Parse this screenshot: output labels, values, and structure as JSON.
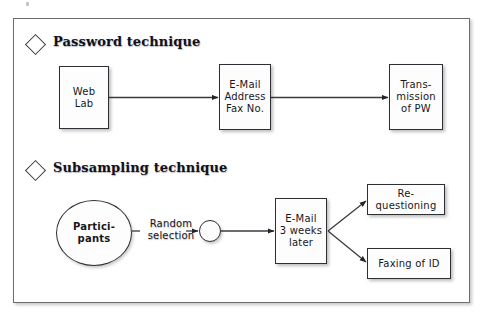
{
  "figure": {
    "sections": [
      {
        "id": "password",
        "bullet_icon": "diamond-bullet-icon",
        "heading": "Password technique",
        "nodes": [
          {
            "id": "web-lab",
            "shape": "box",
            "label": "Web\nLab"
          },
          {
            "id": "email-address",
            "shape": "box",
            "label": "E-Mail\nAddress\nFax No."
          },
          {
            "id": "transmission",
            "shape": "box",
            "label": "Trans-\nmission\nof PW"
          }
        ],
        "edges": [
          {
            "from": "web-lab",
            "to": "email-address",
            "label": ""
          },
          {
            "from": "email-address",
            "to": "transmission",
            "label": ""
          }
        ]
      },
      {
        "id": "subsampling",
        "bullet_icon": "diamond-bullet-icon",
        "heading": "Subsampling technique",
        "nodes": [
          {
            "id": "participants",
            "shape": "circle",
            "label": "Partici-\npants"
          },
          {
            "id": "junction",
            "shape": "circle",
            "label": ""
          },
          {
            "id": "email-3weeks",
            "shape": "box",
            "label": "E-Mail\n3 weeks\nlater"
          },
          {
            "id": "requestioning",
            "shape": "box",
            "label": "Re-\nquestioning"
          },
          {
            "id": "faxing",
            "shape": "box",
            "label": "Faxing of ID"
          }
        ],
        "edges": [
          {
            "from": "participants",
            "to": "junction",
            "label": "Random\nselection"
          },
          {
            "from": "junction",
            "to": "email-3weeks",
            "label": ""
          },
          {
            "from": "email-3weeks",
            "to": "requestioning",
            "label": ""
          },
          {
            "from": "email-3weeks",
            "to": "faxing",
            "label": ""
          }
        ]
      }
    ],
    "colors": {
      "frame_border": "#6d6d6d",
      "node_border": "#2e2e34",
      "node_fill": "#fdfdfd",
      "connector": "#3a3a42",
      "text": "#17171c",
      "background": "#ffffff"
    }
  }
}
